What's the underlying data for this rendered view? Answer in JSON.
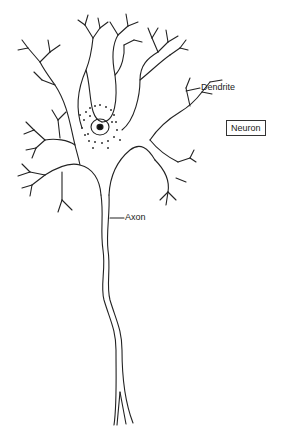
{
  "diagram": {
    "title_box": "Neuron",
    "labels": {
      "dendrite": "Dendrite",
      "axon": "Axon"
    },
    "colors": {
      "line": "#222222",
      "background": "#ffffff"
    }
  }
}
